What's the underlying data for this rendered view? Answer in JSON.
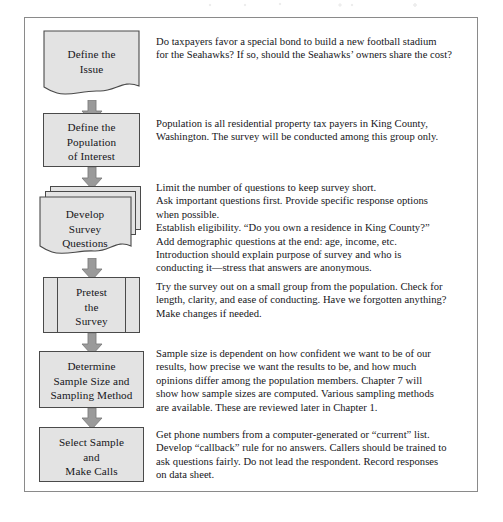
{
  "figure": {
    "type": "survey-process-flowchart",
    "frame_color": "#8a8a8a",
    "shape_fill": "#e3e3e3",
    "shape_stroke": "#4a4a4a",
    "arrow_color": "#9a9a9a",
    "arrow_stroke": "#6e6e6e"
  },
  "steps": [
    {
      "id": "define-the-issue",
      "shape": "document",
      "label": "Define the\nIssue",
      "description": "Do taxpayers favor a special bond to build a new football stadium\nfor the Seahawks? If so, should the Seahawks’ owners share the cost?"
    },
    {
      "id": "define-the-population-of-interest",
      "shape": "rectangle",
      "label": "Define the\nPopulation\nof Interest",
      "description": "Population is all residential property tax payers in King County,\nWashington. The survey will be conducted among this group only."
    },
    {
      "id": "develop-survey-questions",
      "shape": "multi-document",
      "label": "Develop\nSurvey\nQuestions",
      "description": "Limit the number of questions to keep survey short.\nAsk important questions first. Provide specific response options\nwhen possible.\nEstablish eligibility. “Do you own a residence in King County?”\nAdd demographic questions at the end: age, income, etc.\nIntroduction should explain purpose of survey and who is\nconducting it—stress that answers are anonymous."
    },
    {
      "id": "pretest-the-survey",
      "shape": "predefined-process",
      "label": "Pretest\nthe\nSurvey",
      "description": "Try the survey out on a small group from the population. Check for\nlength, clarity, and ease of conducting. Have we forgotten anything?\nMake changes if needed."
    },
    {
      "id": "determine-sample-size-and-sampling-method",
      "shape": "rectangle",
      "label": "Determine\nSample Size and\nSampling Method",
      "description": "Sample size is dependent on how confident we want to be of our\nresults, how precise we want the results to be, and how much\nopinions differ among the population members. Chapter 7 will\nshow how sample sizes are computed. Various sampling methods\nare available. These are reviewed later in Chapter 1."
    },
    {
      "id": "select-sample-and-make-calls",
      "shape": "rectangle",
      "label": "Select Sample\nand\nMake Calls",
      "description": "Get phone numbers from a computer-generated or “current” list.\nDevelop “callback” rule for no answers. Callers should be trained to\nask questions fairly. Do not lead the respondent. Record responses\non data sheet."
    }
  ],
  "arrows": [
    {
      "id": "arrow-1",
      "from": "define-the-issue",
      "to": "define-the-population-of-interest"
    },
    {
      "id": "arrow-2",
      "from": "define-the-population-of-interest",
      "to": "develop-survey-questions"
    },
    {
      "id": "arrow-3",
      "from": "develop-survey-questions",
      "to": "pretest-the-survey"
    },
    {
      "id": "arrow-4",
      "from": "pretest-the-survey",
      "to": "determine-sample-size-and-sampling-method"
    },
    {
      "id": "arrow-5",
      "from": "determine-sample-size-and-sampling-method",
      "to": "select-sample-and-make-calls"
    }
  ]
}
